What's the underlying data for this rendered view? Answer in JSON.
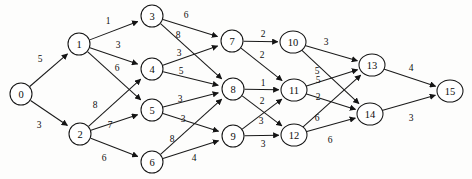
{
  "diagram": {
    "type": "directed-weighted-graph",
    "node_radius": 11,
    "colors": {
      "background": "#fdfdfc",
      "node_fill": "#ffffff",
      "stroke": "#141414",
      "text": "#0d0d0d"
    }
  },
  "chart_data": {
    "type": "graph",
    "directed": true,
    "weighted": true,
    "nodes": [
      {
        "id": "0",
        "label": "0",
        "x": 21,
        "y": 94
      },
      {
        "id": "1",
        "label": "1",
        "x": 79,
        "y": 44
      },
      {
        "id": "2",
        "label": "2",
        "x": 80,
        "y": 134
      },
      {
        "id": "3",
        "label": "3",
        "x": 152,
        "y": 16
      },
      {
        "id": "4",
        "label": "4",
        "x": 152,
        "y": 69
      },
      {
        "id": "5",
        "label": "5",
        "x": 152,
        "y": 110
      },
      {
        "id": "6",
        "label": "6",
        "x": 152,
        "y": 162
      },
      {
        "id": "7",
        "label": "7",
        "x": 232,
        "y": 41
      },
      {
        "id": "8",
        "label": "8",
        "x": 233,
        "y": 89
      },
      {
        "id": "9",
        "label": "9",
        "x": 233,
        "y": 136
      },
      {
        "id": "10",
        "label": "10",
        "x": 293,
        "y": 42
      },
      {
        "id": "11",
        "label": "11",
        "x": 294,
        "y": 90
      },
      {
        "id": "12",
        "label": "12",
        "x": 294,
        "y": 135
      },
      {
        "id": "13",
        "label": "13",
        "x": 372,
        "y": 65
      },
      {
        "id": "14",
        "label": "14",
        "x": 370,
        "y": 114
      },
      {
        "id": "15",
        "label": "15",
        "x": 450,
        "y": 91
      }
    ],
    "edges": [
      {
        "from": "0",
        "to": "1",
        "weight": 5,
        "lx": 40,
        "ly": 59
      },
      {
        "from": "0",
        "to": "2",
        "weight": 3,
        "lx": 39,
        "ly": 125
      },
      {
        "from": "1",
        "to": "3",
        "weight": 1,
        "lx": 108,
        "ly": 21
      },
      {
        "from": "1",
        "to": "4",
        "weight": 3,
        "lx": 118,
        "ly": 45
      },
      {
        "from": "1",
        "to": "5",
        "weight": 6,
        "lx": 117,
        "ly": 68
      },
      {
        "from": "2",
        "to": "4",
        "weight": 8,
        "lx": 95,
        "ly": 105
      },
      {
        "from": "2",
        "to": "5",
        "weight": 7,
        "lx": 110,
        "ly": 125
      },
      {
        "from": "2",
        "to": "6",
        "weight": 6,
        "lx": 104,
        "ly": 158
      },
      {
        "from": "3",
        "to": "7",
        "weight": 6,
        "lx": 186,
        "ly": 15
      },
      {
        "from": "3",
        "to": "8",
        "weight": 8,
        "lx": 178,
        "ly": 35
      },
      {
        "from": "4",
        "to": "7",
        "weight": 3,
        "lx": 179,
        "ly": 53
      },
      {
        "from": "4",
        "to": "8",
        "weight": 5,
        "lx": 181,
        "ly": 71
      },
      {
        "from": "5",
        "to": "8",
        "weight": 3,
        "lx": 180,
        "ly": 99
      },
      {
        "from": "5",
        "to": "9",
        "weight": 3,
        "lx": 183,
        "ly": 119
      },
      {
        "from": "6",
        "to": "8",
        "weight": 8,
        "lx": 172,
        "ly": 139
      },
      {
        "from": "6",
        "to": "9",
        "weight": 4,
        "lx": 194,
        "ly": 158
      },
      {
        "from": "7",
        "to": "10",
        "weight": 2,
        "lx": 263,
        "ly": 34
      },
      {
        "from": "7",
        "to": "11",
        "weight": 2,
        "lx": 262,
        "ly": 55
      },
      {
        "from": "8",
        "to": "11",
        "weight": 1,
        "lx": 263,
        "ly": 83
      },
      {
        "from": "8",
        "to": "12",
        "weight": 2,
        "lx": 262,
        "ly": 101
      },
      {
        "from": "9",
        "to": "11",
        "weight": 3,
        "lx": 261,
        "ly": 121
      },
      {
        "from": "9",
        "to": "12",
        "weight": 3,
        "lx": 263,
        "ly": 144
      },
      {
        "from": "10",
        "to": "13",
        "weight": 3,
        "lx": 326,
        "ly": 42
      },
      {
        "from": "10",
        "to": "14",
        "weight": 5,
        "lx": 317,
        "ly": 71
      },
      {
        "from": "11",
        "to": "13",
        "weight": 5,
        "lx": 318,
        "ly": 80
      },
      {
        "from": "11",
        "to": "14",
        "weight": 2,
        "lx": 318,
        "ly": 97
      },
      {
        "from": "12",
        "to": "13",
        "weight": 6,
        "lx": 317,
        "ly": 118
      },
      {
        "from": "12",
        "to": "14",
        "weight": 6,
        "lx": 330,
        "ly": 140
      },
      {
        "from": "13",
        "to": "15",
        "weight": 4,
        "lx": 411,
        "ly": 68
      },
      {
        "from": "14",
        "to": "15",
        "weight": 3,
        "lx": 411,
        "ly": 118
      }
    ]
  }
}
